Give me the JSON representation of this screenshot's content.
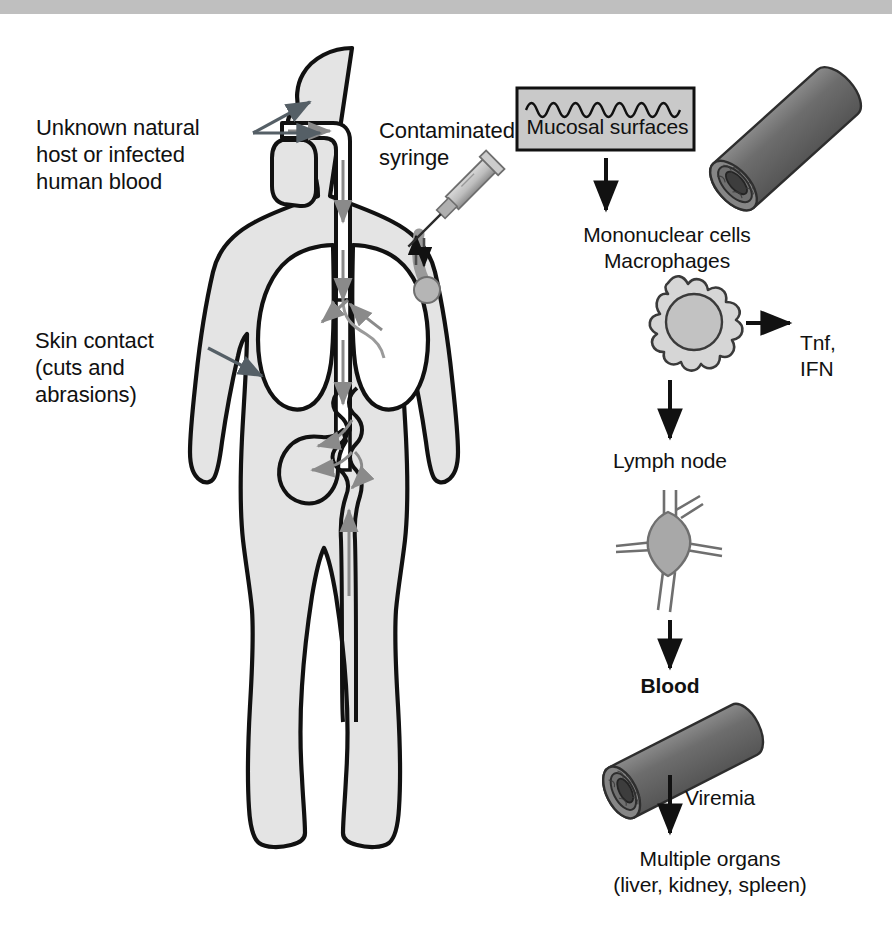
{
  "figure": {
    "type": "medical-pathogenesis-diagram",
    "top_bar_color": "#bfbfbf",
    "background_color": "#ffffff"
  },
  "left_panel": {
    "name": "human-body-transmission-routes",
    "labels": {
      "unknown_host": "Unknown natural\nhost or infected\nhuman blood",
      "skin_contact": "Skin contact\n(cuts and\nabrasions)",
      "contaminated_syringe": "Contaminated\nsyringe"
    },
    "body_parts": [
      "head",
      "nasal-oral-airway",
      "esophagus",
      "trachea",
      "left-lung",
      "right-lung",
      "stomach",
      "intestine",
      "torso",
      "arms",
      "legs",
      "feet"
    ],
    "colors": {
      "body_fill": "#e4e4e4",
      "body_outline": "#111111",
      "lung_fill": "#ffffff",
      "flow_arrow": "#8a8a8a",
      "pointer_arrow": "#555f66",
      "syringe_barrel": "#c6c6c6",
      "syringe_shadow": "#8e8e8e",
      "vessel_in_arm": "#9a9a9a"
    }
  },
  "right_panel": {
    "name": "infection-cascade-flowchart",
    "steps": [
      {
        "id": "mucosal-surfaces",
        "label": "Mucosal surfaces",
        "kind": "box"
      },
      {
        "id": "mononuclear-cells",
        "label": "Mononuclear cells\nMacrophages",
        "kind": "cell"
      },
      {
        "id": "lymph-node",
        "label": "Lymph node",
        "kind": "node"
      },
      {
        "id": "blood",
        "label": "Blood",
        "kind": "vessel"
      },
      {
        "id": "multiple-organs",
        "label": "Multiple organs\n(liver, kidney, spleen)",
        "kind": "text"
      }
    ],
    "side_output": {
      "id": "cytokines",
      "label": "Tnf,\nIFN"
    },
    "arrow_labels": {
      "viremia": "Viremia"
    },
    "colors": {
      "box_fill": "#c9c9c9",
      "box_border": "#111111",
      "vessel_body": "#6d6d6d",
      "vessel_dark": "#3a3a3a",
      "cell_fill": "#d6d6d6",
      "nucleus_fill": "#c2c2c2",
      "node_fill": "#a8a8a8",
      "arrow": "#111111"
    }
  }
}
